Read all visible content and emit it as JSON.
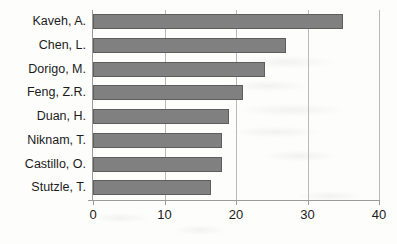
{
  "chart_data": {
    "type": "bar",
    "orientation": "horizontal",
    "title": "",
    "xlabel": "",
    "ylabel": "",
    "categories": [
      "Kaveh, A.",
      "Chen, L.",
      "Dorigo, M.",
      "Feng, Z.R.",
      "Duan, H.",
      "Niknam, T.",
      "Castillo, O.",
      "Stutzle, T."
    ],
    "values": [
      35,
      27,
      24,
      21,
      19,
      18,
      18,
      16.5
    ],
    "xlim": [
      0,
      40
    ],
    "xticks": [
      0,
      10,
      20,
      30,
      40
    ],
    "xtick_labels": [
      "0",
      "10",
      "20",
      "30",
      "40"
    ],
    "grid": true,
    "grid_axis": "x",
    "legend": false,
    "bar_color": "#808080",
    "bar_border_color": "#5e5e5e",
    "axis_color": "#9a9a9a",
    "gridline_color": "#b9b9b9",
    "background_color": "#fdfdfb",
    "text_color": "#1c1c1c"
  }
}
